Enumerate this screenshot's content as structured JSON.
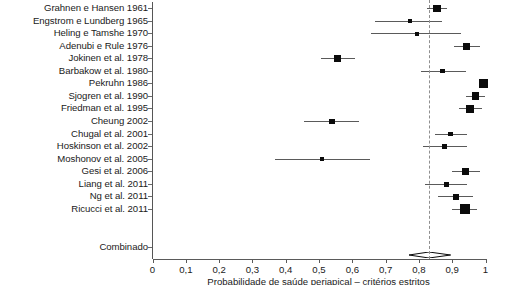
{
  "chart_data": {
    "type": "scatter",
    "subtype": "forest-plot",
    "title": "",
    "xlabel": "Probabilidade de saúde periapical – critérios estritos",
    "ylabel": "",
    "xlim": [
      0,
      1
    ],
    "xticks": [
      0,
      0.1,
      0.2,
      0.3,
      0.4,
      0.5,
      0.6,
      0.7,
      0.8,
      0.9,
      1
    ],
    "xtick_labels": [
      "0",
      "0,1",
      "0,2",
      "0,3",
      "0,4",
      "0,5",
      "0,6",
      "0,7",
      "0,8",
      "0,9",
      "1"
    ],
    "grid": false,
    "legend": null,
    "reference_line": 0.83,
    "summary_label": "Combinado",
    "summary": {
      "estimate": 0.83,
      "ci_low": 0.77,
      "ci_high": 0.895
    },
    "categories": [
      "Grahnen e Hansen 1961",
      "Engstrom e Lundberg 1965",
      "Heling e Tamshe 1970",
      "Adenubi e Rule 1976",
      "Jokinen et al. 1978",
      "Barbakow et al. 1980",
      "Pekruhn 1986",
      "Sjogren et al. 1990",
      "Friedman et al. 1995",
      "Cheung 2002",
      "Chugal et al. 2001",
      "Hoskinson et al. 2002",
      "Moshonov et al. 2005",
      "Gesi et al. 2006",
      "Liang et al. 2011",
      "Ng et al. 2011",
      "Ricucci et al. 2011"
    ],
    "studies": [
      {
        "label": "Grahnen e Hansen 1961",
        "estimate": 0.855,
        "ci_low": 0.825,
        "ci_high": 0.885,
        "weight": 0.52
      },
      {
        "label": "Engstrom e Lundberg 1965",
        "estimate": 0.772,
        "ci_low": 0.668,
        "ci_high": 0.868,
        "weight": 0.12
      },
      {
        "label": "Heling e Tamshe 1970",
        "estimate": 0.793,
        "ci_low": 0.655,
        "ci_high": 0.925,
        "weight": 0.1
      },
      {
        "label": "Adenubi e Rule 1976",
        "estimate": 0.943,
        "ci_low": 0.905,
        "ci_high": 0.982,
        "weight": 0.45
      },
      {
        "label": "Jokinen et al. 1978",
        "estimate": 0.556,
        "ci_low": 0.505,
        "ci_high": 0.607,
        "weight": 0.48
      },
      {
        "label": "Barbakow et al. 1980",
        "estimate": 0.871,
        "ci_low": 0.805,
        "ci_high": 0.94,
        "weight": 0.14
      },
      {
        "label": "Pekruhn 1986",
        "estimate": 0.994,
        "ci_low": 0.982,
        "ci_high": 1.0,
        "weight": 0.62
      },
      {
        "label": "Sjogren et al. 1990",
        "estimate": 0.97,
        "ci_low": 0.94,
        "ci_high": 0.998,
        "weight": 0.5
      },
      {
        "label": "Friedman et al. 1995",
        "estimate": 0.954,
        "ci_low": 0.92,
        "ci_high": 0.988,
        "weight": 0.46
      },
      {
        "label": "Cheung 2002",
        "estimate": 0.538,
        "ci_low": 0.455,
        "ci_high": 0.62,
        "weight": 0.3
      },
      {
        "label": "Chugal et al. 2001",
        "estimate": 0.895,
        "ci_low": 0.848,
        "ci_high": 0.943,
        "weight": 0.2
      },
      {
        "label": "Hoskinson et al. 2002",
        "estimate": 0.877,
        "ci_low": 0.812,
        "ci_high": 0.943,
        "weight": 0.12
      },
      {
        "label": "Moshonov et al. 2005",
        "estimate": 0.51,
        "ci_low": 0.368,
        "ci_high": 0.652,
        "weight": 0.08
      },
      {
        "label": "Gesi et al. 2006",
        "estimate": 0.94,
        "ci_low": 0.898,
        "ci_high": 0.982,
        "weight": 0.38
      },
      {
        "label": "Liang et al. 2011",
        "estimate": 0.883,
        "ci_low": 0.818,
        "ci_high": 0.945,
        "weight": 0.18
      },
      {
        "label": "Ng et al. 2011",
        "estimate": 0.912,
        "ci_low": 0.858,
        "ci_high": 0.962,
        "weight": 0.32
      },
      {
        "label": "Ricucci et al. 2011",
        "estimate": 0.938,
        "ci_low": 0.9,
        "ci_high": 0.975,
        "weight": 0.72
      }
    ]
  },
  "colors": {
    "marker": "#0b0b0b",
    "ci_line": "#5a5a5a",
    "axis": "#5a5a5a",
    "reference_line": "#8f8f8f",
    "text": "#1a1a1a",
    "background": "#ffffff"
  }
}
